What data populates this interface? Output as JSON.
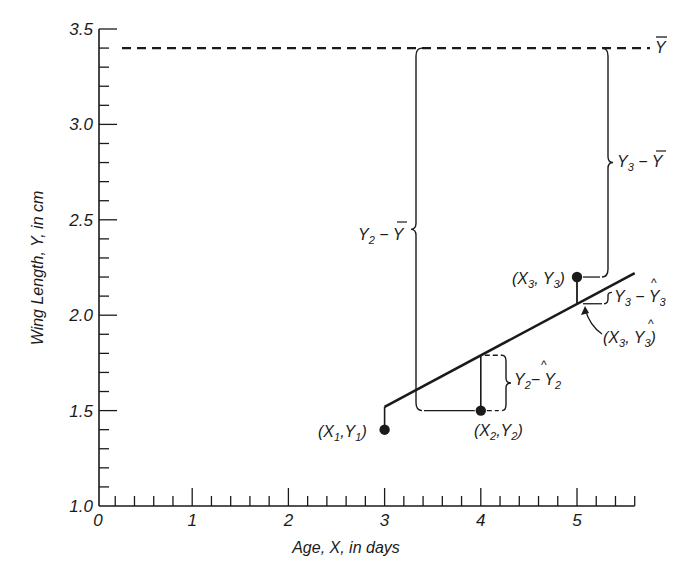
{
  "chart_data": {
    "type": "scatter",
    "title": "",
    "xlabel": "Age, X, in days",
    "ylabel": "Wing Length, Y, in cm",
    "xlim": [
      0,
      5.6
    ],
    "ylim": [
      1.0,
      3.5
    ],
    "x_ticks": [
      0,
      1,
      2,
      3,
      4,
      5
    ],
    "x_tick_labels": [
      "0",
      "1",
      "2",
      "3",
      "4",
      "5"
    ],
    "x_minor_step": 0.2,
    "y_ticks": [
      1.0,
      1.5,
      2.0,
      2.5,
      3.0,
      3.5
    ],
    "y_tick_labels": [
      "1.0",
      "1.5",
      "2.0",
      "2.5",
      "3.0",
      "3.5"
    ],
    "y_minor_step": 0.1,
    "grid": false,
    "points": [
      {
        "label": "(X1,Y1)",
        "x": 3.0,
        "y": 1.4
      },
      {
        "label": "(X2,Y2)",
        "x": 4.0,
        "y": 1.5
      },
      {
        "label": "(X3,Y3)",
        "x": 5.0,
        "y": 2.2
      }
    ],
    "regression_line": {
      "x": [
        3.0,
        5.6
      ],
      "y": [
        1.52,
        2.22
      ],
      "yhat_at_4": 1.79,
      "yhat_at_5": 2.06
    },
    "mean_line": {
      "label": "Y-bar",
      "y": 3.4,
      "style": "dashed"
    },
    "annotations": [
      {
        "id": "y2_minus_ybar",
        "text": "Y2 − Ȳ"
      },
      {
        "id": "y3_minus_ybar",
        "text": "Y3 − Ȳ"
      },
      {
        "id": "y2_minus_y2hat",
        "text": "Y2 − Ŷ2"
      },
      {
        "id": "y3_minus_y3hat",
        "text": "Y3 − Ŷ3"
      },
      {
        "id": "x3_y3hat",
        "text": "(X3, Ŷ3)"
      }
    ]
  },
  "labels": {
    "ybar": "Y",
    "p1": {
      "a": "(X",
      "s1": "1",
      "b": ",Y",
      "s2": "1",
      "c": ")"
    },
    "p2": {
      "a": "(X",
      "s1": "2",
      "b": ",Y",
      "s2": "2",
      "c": ")"
    },
    "p3": {
      "a": "(X",
      "s1": "3",
      "b": ", Y",
      "s2": "3",
      "c": ")"
    },
    "y2ybar": {
      "a": "Y",
      "s": "2",
      "b": " − Y"
    },
    "y3ybar": {
      "a": "Y",
      "s": "3",
      "b": " − Y"
    },
    "y2hat": {
      "a": "Y",
      "s": "2",
      "b": "− Y",
      "s2": "2"
    },
    "y3hat": {
      "a": "Y",
      "s": "3",
      "b": " − Y",
      "s2": "3"
    },
    "x3hat": {
      "a": "(X",
      "s1": "3",
      "b": ", Y",
      "s2": "3",
      "c": ")"
    }
  },
  "colors": {
    "ink": "#1a1a1a",
    "background": "#ffffff"
  }
}
